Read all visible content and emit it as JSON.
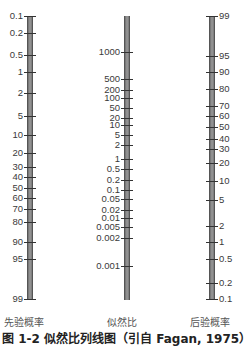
{
  "figure": {
    "type": "Fagan nomogram",
    "caption": "图 1-2  似然比列线图（引自 Fagan, 1975）"
  },
  "axes": {
    "pretest": {
      "title": "先验概率",
      "ticks": [
        {
          "label": "0.1",
          "y": 16
        },
        {
          "label": "0.2",
          "y": 33
        },
        {
          "label": "0.5",
          "y": 55
        },
        {
          "label": "1",
          "y": 72
        },
        {
          "label": "2",
          "y": 93
        },
        {
          "label": "5",
          "y": 116
        },
        {
          "label": "10",
          "y": 135
        },
        {
          "label": "20",
          "y": 153
        },
        {
          "label": "30",
          "y": 167
        },
        {
          "label": "40",
          "y": 177
        },
        {
          "label": "50",
          "y": 188
        },
        {
          "label": "60",
          "y": 198
        },
        {
          "label": "70",
          "y": 209
        },
        {
          "label": "80",
          "y": 222
        },
        {
          "label": "90",
          "y": 242
        },
        {
          "label": "95",
          "y": 259
        },
        {
          "label": "99",
          "y": 299
        }
      ]
    },
    "likelihood_ratio": {
      "title": "似然比",
      "ticks": [
        {
          "label": "1000",
          "y": 52
        },
        {
          "label": "500",
          "y": 79
        },
        {
          "label": "200",
          "y": 90
        },
        {
          "label": "100",
          "y": 98
        },
        {
          "label": "50",
          "y": 108
        },
        {
          "label": "20",
          "y": 118
        },
        {
          "label": "10",
          "y": 125
        },
        {
          "label": "5",
          "y": 135
        },
        {
          "label": "2",
          "y": 145
        },
        {
          "label": "1",
          "y": 159
        },
        {
          "label": "0.5",
          "y": 169
        },
        {
          "label": "0.2",
          "y": 180
        },
        {
          "label": "0.1",
          "y": 190
        },
        {
          "label": "0.05",
          "y": 199
        },
        {
          "label": "0.02",
          "y": 210
        },
        {
          "label": "0.01",
          "y": 218
        },
        {
          "label": "0.005",
          "y": 227
        },
        {
          "label": "0.002",
          "y": 238
        },
        {
          "label": "0.001",
          "y": 266
        }
      ]
    },
    "posttest": {
      "title": "后验概率",
      "ticks": [
        {
          "label": "99",
          "y": 16
        },
        {
          "label": "95",
          "y": 56
        },
        {
          "label": "90",
          "y": 72
        },
        {
          "label": "80",
          "y": 89
        },
        {
          "label": "70",
          "y": 106
        },
        {
          "label": "60",
          "y": 116
        },
        {
          "label": "50",
          "y": 127
        },
        {
          "label": "40",
          "y": 139
        },
        {
          "label": "30",
          "y": 149
        },
        {
          "label": "20",
          "y": 163
        },
        {
          "label": "10",
          "y": 181
        },
        {
          "label": "5",
          "y": 200
        },
        {
          "label": "2",
          "y": 226
        },
        {
          "label": "1",
          "y": 242
        },
        {
          "label": "0.5",
          "y": 259
        },
        {
          "label": "0.2",
          "y": 283
        },
        {
          "label": "0.1",
          "y": 299
        }
      ]
    }
  },
  "colors": {
    "bar": "#8a8a8a",
    "tick": "#333333",
    "text": "#3a3a3a"
  }
}
